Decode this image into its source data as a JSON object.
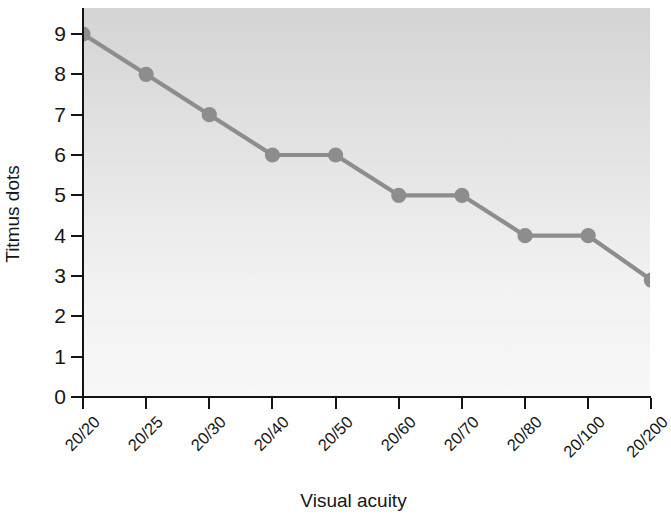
{
  "chart_data": {
    "type": "line",
    "title": "",
    "subtitle": "",
    "xlabel": "Visual acuity",
    "ylabel": "Titmus dots",
    "categories": [
      "20/20",
      "20/25",
      "20/30",
      "20/40",
      "20/50",
      "20/60",
      "20/70",
      "20/80",
      "20/100",
      "20/200"
    ],
    "values": [
      9,
      8,
      7,
      6,
      6,
      5,
      5,
      4,
      4,
      2.9
    ],
    "series": [
      {
        "name": "Titmus dots",
        "values": [
          9,
          8,
          7,
          6,
          6,
          5,
          5,
          4,
          4,
          2.9
        ]
      }
    ],
    "ylim": [
      0,
      9
    ],
    "yticks": [
      0,
      1,
      2,
      3,
      4,
      5,
      6,
      7,
      8,
      9
    ],
    "ytick_labels": [
      "0",
      "1",
      "2",
      "3",
      "4",
      "5",
      "6",
      "7",
      "8",
      "9"
    ],
    "xtick_labels": [
      "20/20",
      "20/25",
      "20/30",
      "20/40",
      "20/50",
      "20/60",
      "20/70",
      "20/80",
      "20/100",
      "20/200"
    ],
    "grid": false,
    "legend": null,
    "legend_position": "none",
    "annotations": [],
    "line_color": "#8d8d8d",
    "marker_color": "#8d8d8d",
    "marker_shape": "circle",
    "plot_background_top_color": "#d4d4d4",
    "plot_background_bottom_color": "#f7f7f7",
    "axis_color": "#141414",
    "text_color": "#161616"
  }
}
